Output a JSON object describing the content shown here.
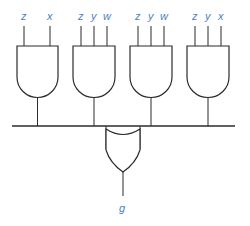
{
  "diagram": {
    "type": "logic-circuit",
    "colors": {
      "label": "#4a7fc1",
      "line": "#2b2b2b"
    },
    "and_gates": [
      {
        "id": "and1",
        "inputs": [
          "z",
          "x"
        ]
      },
      {
        "id": "and2",
        "inputs": [
          "z",
          "y",
          "w"
        ]
      },
      {
        "id": "and3",
        "inputs": [
          "z",
          "y",
          "w"
        ]
      },
      {
        "id": "and4",
        "inputs": [
          "z",
          "y",
          "x"
        ]
      }
    ],
    "or_gate": {
      "id": "or1",
      "inputs": [
        "and1",
        "and2",
        "and3",
        "and4"
      ],
      "output": "g"
    },
    "labels": {
      "g1_in0": "z",
      "g1_in1": "x",
      "g2_in0": "z",
      "g2_in1": "y",
      "g2_in2": "w",
      "g3_in0": "z",
      "g3_in1": "y",
      "g3_in2": "w",
      "g4_in0": "z",
      "g4_in1": "y",
      "g4_in2": "x",
      "output": "g"
    }
  }
}
